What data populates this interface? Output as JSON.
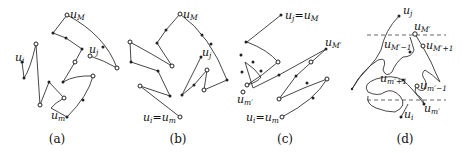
{
  "figure": {
    "panels": [
      {
        "id": "a",
        "caption": "(a)",
        "labels": {
          "u_i": {
            "base": "u",
            "sub": "i"
          },
          "u_M": {
            "base": "u",
            "sub": "M"
          },
          "u_j": {
            "base": "u",
            "sub": "j"
          },
          "u_m": {
            "base": "u",
            "sub": "m"
          }
        }
      },
      {
        "id": "b",
        "caption": "(b)",
        "labels": {
          "u_M": {
            "base": "u",
            "sub": "M"
          },
          "u_j": {
            "base": "u",
            "sub": "j"
          },
          "u_i_eq_u_m": {
            "base1": "u",
            "sub1": "i",
            "eq": "=",
            "base2": "u",
            "sub2": "m"
          }
        }
      },
      {
        "id": "c",
        "caption": "(c)",
        "labels": {
          "u_j_eq_u_M": {
            "base1": "u",
            "sub1": "j",
            "eq": "=",
            "base2": "u",
            "sub2": "M"
          },
          "u_M_prime": {
            "base": "u",
            "sub": "M′"
          },
          "u_m_prime": {
            "base": "u",
            "sub": "m′"
          },
          "u_i_eq_u_m": {
            "base1": "u",
            "sub1": "i",
            "eq": "=",
            "base2": "u",
            "sub2": "m"
          }
        }
      },
      {
        "id": "d",
        "caption": "(d)",
        "labels": {
          "u_j": {
            "base": "u",
            "sub": "j"
          },
          "u_M_prime": {
            "base": "u",
            "sub": "M′"
          },
          "u_M_prime_minus_1": {
            "base": "u",
            "sub": "M′−1"
          },
          "u_M_prime_plus_1": {
            "base": "u",
            "sub": "M′+1"
          },
          "u_m_prime_plus_1": {
            "base": "u",
            "sub": "m′+1"
          },
          "u_m_prime_minus_1": {
            "base": "u",
            "sub": "m′−1"
          },
          "u_m_prime": {
            "base": "u",
            "sub": "m′"
          },
          "u_i": {
            "base": "u",
            "sub": "i"
          }
        }
      }
    ]
  }
}
